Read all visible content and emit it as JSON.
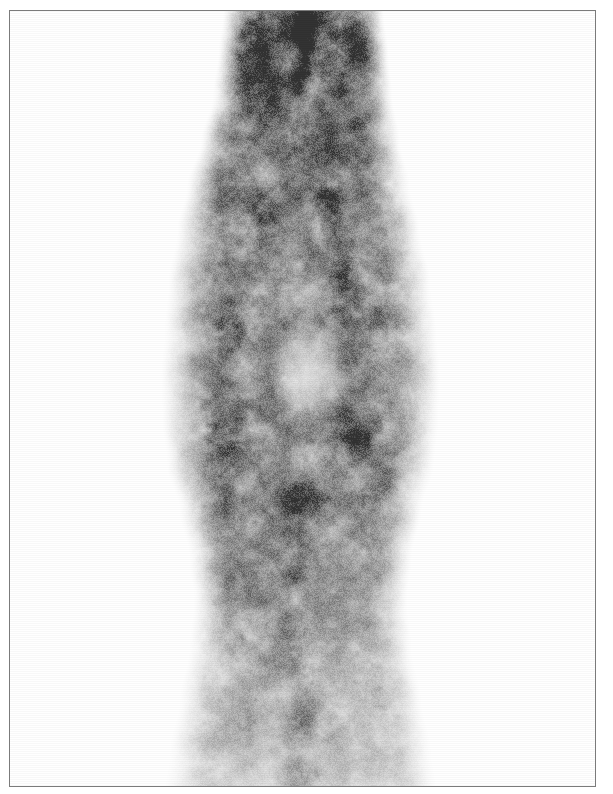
{
  "document": {
    "kind": "scintigraphy-scan",
    "page_width": 613,
    "page_height": 794,
    "background_color": "#ffffff",
    "border_color": "#7c7c7c",
    "caption": ""
  },
  "plate": {
    "left": 9,
    "top": 10,
    "width": 587,
    "height": 777,
    "border_width": 1
  },
  "scan": {
    "modality": "planar nuclear medicine scintigram",
    "colormap": "grayscale-inverted",
    "background": "#ffffff",
    "min_intensity_color": "#ffffff",
    "mid_intensity_color": "#9a9a9a",
    "max_intensity_color": "#3d3d3d",
    "grain": "fine speckle, 2-4 px",
    "orientation": "vertical column, anterior view",
    "regions": [
      {
        "name": "superior-neck",
        "label": "superior narrow segment",
        "x": 235,
        "y": 11,
        "width": 140,
        "height": 150,
        "intensity": "high"
      },
      {
        "name": "focal-hot-streak",
        "label": "focal linear uptake",
        "x": 292,
        "y": 14,
        "width": 26,
        "height": 80,
        "intensity": "very high"
      },
      {
        "name": "mid-expansion",
        "label": "lozenge expansion",
        "x": 185,
        "y": 180,
        "width": 230,
        "height": 340,
        "intensity": "moderate"
      },
      {
        "name": "photopenic-center",
        "label": "central cold defect",
        "x": 272,
        "y": 325,
        "width": 72,
        "height": 95,
        "intensity": "low"
      },
      {
        "name": "left-rim",
        "label": "left dense rim",
        "x": 196,
        "y": 270,
        "width": 70,
        "height": 250,
        "intensity": "high"
      },
      {
        "name": "right-rim",
        "label": "right dense rim",
        "x": 330,
        "y": 250,
        "width": 70,
        "height": 260,
        "intensity": "high"
      },
      {
        "name": "inferior-column",
        "label": "inferior tapering column",
        "x": 200,
        "y": 540,
        "width": 200,
        "height": 245,
        "intensity": "moderate-low"
      }
    ],
    "profile": [
      {
        "y": 11,
        "center_x": 303,
        "half_width": 66,
        "peak": 0.78
      },
      {
        "y": 50,
        "center_x": 303,
        "half_width": 70,
        "peak": 0.8
      },
      {
        "y": 95,
        "center_x": 302,
        "half_width": 74,
        "peak": 0.7
      },
      {
        "y": 140,
        "center_x": 300,
        "half_width": 82,
        "peak": 0.62
      },
      {
        "y": 185,
        "center_x": 298,
        "half_width": 92,
        "peak": 0.58
      },
      {
        "y": 230,
        "center_x": 298,
        "half_width": 100,
        "peak": 0.56
      },
      {
        "y": 280,
        "center_x": 299,
        "half_width": 108,
        "peak": 0.56
      },
      {
        "y": 330,
        "center_x": 300,
        "half_width": 112,
        "peak": 0.54
      },
      {
        "y": 375,
        "center_x": 300,
        "half_width": 115,
        "peak": 0.52
      },
      {
        "y": 420,
        "center_x": 300,
        "half_width": 114,
        "peak": 0.54
      },
      {
        "y": 465,
        "center_x": 300,
        "half_width": 110,
        "peak": 0.55
      },
      {
        "y": 510,
        "center_x": 300,
        "half_width": 100,
        "peak": 0.52
      },
      {
        "y": 555,
        "center_x": 300,
        "half_width": 92,
        "peak": 0.48
      },
      {
        "y": 600,
        "center_x": 300,
        "half_width": 88,
        "peak": 0.44
      },
      {
        "y": 650,
        "center_x": 300,
        "half_width": 92,
        "peak": 0.4
      },
      {
        "y": 700,
        "center_x": 300,
        "half_width": 100,
        "peak": 0.34
      },
      {
        "y": 750,
        "center_x": 300,
        "half_width": 108,
        "peak": 0.28
      },
      {
        "y": 786,
        "center_x": 300,
        "half_width": 112,
        "peak": 0.22
      }
    ],
    "hotspots": [
      {
        "x": 305,
        "y": 30,
        "rx": 16,
        "ry": 34,
        "a": 0.62
      },
      {
        "x": 300,
        "y": 72,
        "rx": 14,
        "ry": 26,
        "a": 0.5
      },
      {
        "x": 262,
        "y": 210,
        "rx": 26,
        "ry": 40,
        "a": 0.3
      },
      {
        "x": 330,
        "y": 200,
        "rx": 24,
        "ry": 44,
        "a": 0.3
      },
      {
        "x": 345,
        "y": 295,
        "rx": 22,
        "ry": 46,
        "a": 0.38
      },
      {
        "x": 232,
        "y": 330,
        "rx": 24,
        "ry": 48,
        "a": 0.3
      },
      {
        "x": 226,
        "y": 440,
        "rx": 30,
        "ry": 44,
        "a": 0.36
      },
      {
        "x": 356,
        "y": 430,
        "rx": 30,
        "ry": 46,
        "a": 0.34
      },
      {
        "x": 300,
        "y": 500,
        "rx": 34,
        "ry": 30,
        "a": 0.3
      },
      {
        "x": 296,
        "y": 560,
        "rx": 26,
        "ry": 40,
        "a": 0.3
      },
      {
        "x": 290,
        "y": 640,
        "rx": 24,
        "ry": 44,
        "a": 0.26
      },
      {
        "x": 300,
        "y": 720,
        "rx": 26,
        "ry": 40,
        "a": 0.22
      },
      {
        "x": 300,
        "y": 775,
        "rx": 30,
        "ry": 26,
        "a": 0.24
      }
    ],
    "coldspots": [
      {
        "x": 308,
        "y": 372,
        "rx": 40,
        "ry": 54,
        "a": 0.72
      },
      {
        "x": 300,
        "y": 300,
        "rx": 26,
        "ry": 30,
        "a": 0.3
      },
      {
        "x": 300,
        "y": 460,
        "rx": 24,
        "ry": 26,
        "a": 0.26
      }
    ]
  }
}
